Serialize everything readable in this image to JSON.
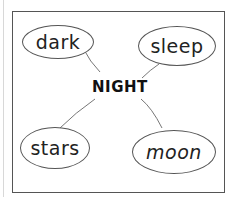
{
  "diagram": {
    "type": "mind-map",
    "center": "NIGHT",
    "nodes": [
      {
        "id": "dark",
        "label": "dark"
      },
      {
        "id": "sleep",
        "label": "sleep"
      },
      {
        "id": "stars",
        "label": "stars"
      },
      {
        "id": "moon",
        "label": "moon"
      }
    ],
    "edges": [
      [
        "NIGHT",
        "dark"
      ],
      [
        "NIGHT",
        "sleep"
      ],
      [
        "NIGHT",
        "stars"
      ],
      [
        "NIGHT",
        "moon"
      ]
    ]
  }
}
